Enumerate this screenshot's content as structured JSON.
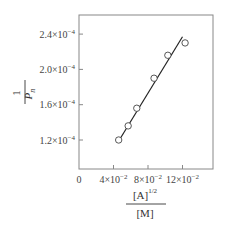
{
  "chart_data": {
    "type": "scatter",
    "title": "",
    "xlabel": "[A]^1/2 / [M]",
    "ylabel": "1 / P_n",
    "xlabel_parts": {
      "numerator": "[A]",
      "exponent": "1/2",
      "denominator": "[M]"
    },
    "ylabel_parts": {
      "numerator": "1",
      "denominator": "P",
      "subscript": "n"
    },
    "xlim": [
      0,
      0.155
    ],
    "ylim": [
      8e-05,
      0.00026
    ],
    "x_ticks": [
      {
        "value": 0,
        "label": "0"
      },
      {
        "value": 0.04,
        "label": "4×10",
        "exp": "−2"
      },
      {
        "value": 0.08,
        "label": "8×10",
        "exp": "−2"
      },
      {
        "value": 0.12,
        "label": "12×10",
        "exp": "−2"
      }
    ],
    "y_ticks": [
      {
        "value": 0.00012,
        "label": "1.2×10",
        "exp": "−4"
      },
      {
        "value": 0.00016,
        "label": "1.6×10",
        "exp": "−4"
      },
      {
        "value": 0.0002,
        "label": "2.0×10",
        "exp": "−4"
      },
      {
        "value": 0.00024,
        "label": "2.4×10",
        "exp": "−4"
      }
    ],
    "series": [
      {
        "name": "data",
        "marker": "open-circle",
        "x": [
          0.046,
          0.057,
          0.067,
          0.087,
          0.103,
          0.123
        ],
        "y": [
          0.00012,
          0.000136,
          0.000156,
          0.00019,
          0.000216,
          0.00023
        ]
      },
      {
        "name": "fit",
        "style": "line",
        "x": [
          0.048,
          0.12
        ],
        "y": [
          0.000122,
          0.000237
        ]
      }
    ],
    "grid": false,
    "legend": null
  }
}
